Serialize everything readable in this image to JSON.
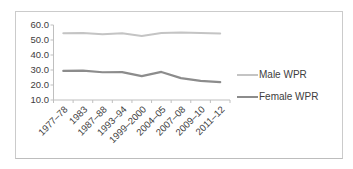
{
  "chart_data": {
    "type": "line",
    "title": "",
    "categories": [
      "1977–78",
      "1983",
      "1987–88",
      "1993–94",
      "1999–2000",
      "2004–05",
      "2007–08",
      "2009–10",
      "2011–12"
    ],
    "series": [
      {
        "name": "Male WPR",
        "values": [
          54.5,
          54.7,
          53.9,
          54.5,
          52.7,
          54.7,
          55.0,
          54.6,
          54.4
        ],
        "color": "#c4c4c4",
        "stroke_width": 2
      },
      {
        "name": "Female WPR",
        "values": [
          29.4,
          29.6,
          28.5,
          28.6,
          25.9,
          28.7,
          24.6,
          22.8,
          21.9
        ],
        "color": "#8c8c8c",
        "stroke_width": 2.2
      }
    ],
    "ylim": [
      10,
      60
    ],
    "ytick_step": 10,
    "ytick_labels": [
      "60.0",
      "50.0",
      "40.0",
      "30.0",
      "20.0",
      "10.0"
    ],
    "xlabel": "",
    "ylabel": "",
    "grid": false,
    "legend_position": "right",
    "axis_color": "#bfbfbf",
    "text_color": "#3d3d3d",
    "tick_label_font_size": 9.5,
    "x_labels_rotation_deg": -45
  },
  "legend": {
    "items": [
      {
        "label": "Male WPR",
        "swatch_color": "#c4c4c4"
      },
      {
        "label": "Female WPR",
        "swatch_color": "#8c8c8c"
      }
    ]
  }
}
